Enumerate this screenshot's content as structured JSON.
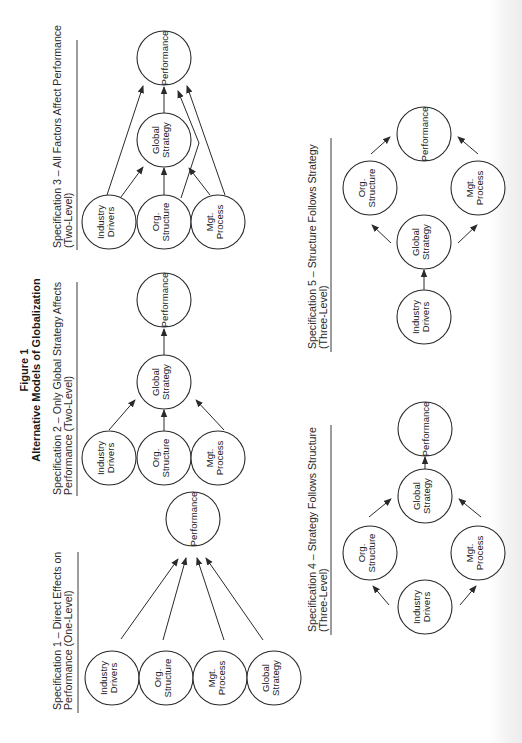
{
  "figure": {
    "number_label": "Figure 1",
    "title": "Alternative Models of Globalization",
    "orientation": "rotated 90 degrees counter-clockwise"
  },
  "colors": {
    "stroke": "#2a2a2a",
    "text": "#222222",
    "background": "#ffffff"
  },
  "specifications": [
    {
      "id": "spec1",
      "label_line1": "Specification 1 – Direct Effects on",
      "label_line2": "Performance (One-Level)",
      "nodes": [
        {
          "id": "perf",
          "lines": [
            "Performance"
          ],
          "cx": 193,
          "cy": 519
        },
        {
          "id": "ind",
          "lines": [
            "Industry",
            "Drivers"
          ],
          "cx": 112,
          "cy": 678
        },
        {
          "id": "org",
          "lines": [
            "Org.",
            "Structure"
          ],
          "cx": 166,
          "cy": 678
        },
        {
          "id": "mgt",
          "lines": [
            "Mgt.",
            "Process"
          ],
          "cx": 220,
          "cy": 678
        },
        {
          "id": "gs",
          "lines": [
            "Global",
            "Strategy"
          ],
          "cx": 274,
          "cy": 678
        }
      ],
      "edges": [
        {
          "from": "ind",
          "to": "perf",
          "points": [
            [
              121,
              639
            ],
            [
              178,
              559
            ]
          ]
        },
        {
          "from": "org",
          "to": "perf",
          "points": [
            [
              163,
              640
            ],
            [
              186,
              558
            ]
          ]
        },
        {
          "from": "mgt",
          "to": "perf",
          "points": [
            [
              224,
              640
            ],
            [
              197,
              558
            ]
          ]
        },
        {
          "from": "gs",
          "to": "perf",
          "points": [
            [
              263,
              640
            ],
            [
              206,
              558
            ]
          ]
        }
      ]
    },
    {
      "id": "spec2",
      "label_line1": "Specification 2 – Only Global Strategy Affects",
      "label_line2": "Performance (Two-Level)",
      "nodes": [
        {
          "id": "perf",
          "lines": [
            "Performance"
          ],
          "cx": 164,
          "cy": 300
        },
        {
          "id": "gs",
          "lines": [
            "Global",
            "Strategy"
          ],
          "cx": 164,
          "cy": 382
        },
        {
          "id": "ind",
          "lines": [
            "Industry",
            "Drivers"
          ],
          "cx": 109,
          "cy": 458
        },
        {
          "id": "org",
          "lines": [
            "Org.",
            "Structure"
          ],
          "cx": 164,
          "cy": 458
        },
        {
          "id": "mgt",
          "lines": [
            "Mgt.",
            "Process"
          ],
          "cx": 218,
          "cy": 458
        }
      ],
      "edges": [
        {
          "from": "gs",
          "to": "perf",
          "points": [
            [
              164,
              355
            ],
            [
              164,
              329
            ]
          ]
        },
        {
          "from": "ind",
          "to": "gs",
          "points": [
            [
              109,
              430
            ],
            [
              135,
              400
            ]
          ]
        },
        {
          "from": "org",
          "to": "gs",
          "points": [
            [
              164,
              431
            ],
            [
              164,
              410
            ]
          ]
        },
        {
          "from": "mgt",
          "to": "gs",
          "points": [
            [
              224,
              430
            ],
            [
              196,
              400
            ]
          ]
        }
      ]
    },
    {
      "id": "spec3",
      "label_line1": "Specification 3 –  All Factors Affect Performance",
      "label_line2": "(Two-Level)",
      "nodes": [
        {
          "id": "perf",
          "lines": [
            "Performance"
          ],
          "cx": 164,
          "cy": 58
        },
        {
          "id": "gs",
          "lines": [
            "Global",
            "Strategy"
          ],
          "cx": 164,
          "cy": 140
        },
        {
          "id": "ind",
          "lines": [
            "Industry",
            "Drivers"
          ],
          "cx": 109,
          "cy": 222
        },
        {
          "id": "org",
          "lines": [
            "Org.",
            "Structure"
          ],
          "cx": 164,
          "cy": 222
        },
        {
          "id": "mgt",
          "lines": [
            "Mgt.",
            "Process"
          ],
          "cx": 218,
          "cy": 222
        }
      ],
      "edges": [
        {
          "from": "ind",
          "to": "perf",
          "points": [
            [
              107,
              195
            ],
            [
              143,
              86
            ]
          ]
        },
        {
          "from": "ind",
          "to": "gs",
          "points": [
            [
              121,
              197
            ],
            [
              143,
              167
            ]
          ]
        },
        {
          "from": "gs",
          "to": "perf",
          "points": [
            [
              164,
              113
            ],
            [
              164,
              87
            ]
          ]
        },
        {
          "from": "org",
          "to": "gs",
          "points": [
            [
              164,
              195
            ],
            [
              164,
              168
            ]
          ]
        },
        {
          "from": "org",
          "to": "perf",
          "points": [
            [
              181,
              198
            ],
            [
              199,
              143
            ],
            [
              178,
              91
            ]
          ]
        },
        {
          "from": "mgt",
          "to": "gs",
          "points": [
            [
              210,
              195
            ],
            [
              189,
              168
            ]
          ]
        },
        {
          "from": "mgt",
          "to": "perf",
          "points": [
            [
              225,
              195
            ],
            [
              187,
              86
            ]
          ]
        }
      ]
    },
    {
      "id": "spec4",
      "label_line1": "Specification 4 – Strategy Follows Structure",
      "label_line2": "(Three-Level)",
      "nodes": [
        {
          "id": "perf",
          "lines": [
            "Performance"
          ],
          "cx": 425,
          "cy": 429
        },
        {
          "id": "gs",
          "lines": [
            "Global",
            "Strategy"
          ],
          "cx": 425,
          "cy": 496
        },
        {
          "id": "org",
          "lines": [
            "Org.",
            "Structure"
          ],
          "cx": 370,
          "cy": 553
        },
        {
          "id": "mgt",
          "lines": [
            "Mgt.",
            "Process"
          ],
          "cx": 478,
          "cy": 553
        },
        {
          "id": "ind",
          "lines": [
            "Industry",
            "Drivers"
          ],
          "cx": 425,
          "cy": 607
        }
      ],
      "edges": [
        {
          "from": "gs",
          "to": "perf",
          "points": [
            [
              425,
              469
            ],
            [
              425,
              457
            ]
          ]
        },
        {
          "from": "org",
          "to": "gs",
          "points": [
            [
              369,
              517
            ],
            [
              391,
              499
            ]
          ]
        },
        {
          "from": "mgt",
          "to": "gs",
          "points": [
            [
              481,
              517
            ],
            [
              459,
              499
            ]
          ]
        },
        {
          "from": "ind",
          "to": "org",
          "points": [
            [
              389,
              605
            ],
            [
              373,
              586
            ]
          ]
        },
        {
          "from": "ind",
          "to": "mgt",
          "points": [
            [
              460,
              605
            ],
            [
              476,
              586
            ]
          ]
        }
      ]
    },
    {
      "id": "spec5",
      "label_line1": "Specification 5 – Structure Follows Strategy",
      "label_line2": "(Three-Level)",
      "nodes": [
        {
          "id": "perf",
          "lines": [
            "Performance"
          ],
          "cx": 424,
          "cy": 134
        },
        {
          "id": "org",
          "lines": [
            "Org.",
            "Structure"
          ],
          "cx": 370,
          "cy": 188
        },
        {
          "id": "mgt",
          "lines": [
            "Mgt.",
            "Process"
          ],
          "cx": 478,
          "cy": 188
        },
        {
          "id": "gs",
          "lines": [
            "Global",
            "Strategy"
          ],
          "cx": 424,
          "cy": 242
        },
        {
          "id": "ind",
          "lines": [
            "Industry",
            "Drivers"
          ],
          "cx": 424,
          "cy": 317
        }
      ],
      "edges": [
        {
          "from": "org",
          "to": "perf",
          "points": [
            [
              371,
              154
            ],
            [
              390,
              137
            ]
          ]
        },
        {
          "from": "mgt",
          "to": "perf",
          "points": [
            [
              478,
              154
            ],
            [
              458,
              137
            ]
          ]
        },
        {
          "from": "gs",
          "to": "org",
          "points": [
            [
              391,
              243
            ],
            [
              372,
              225
            ]
          ]
        },
        {
          "from": "gs",
          "to": "mgt",
          "points": [
            [
              458,
              243
            ],
            [
              477,
              225
            ]
          ]
        },
        {
          "from": "ind",
          "to": "gs",
          "points": [
            [
              424,
              290
            ],
            [
              424,
              270
            ]
          ]
        }
      ]
    }
  ],
  "layout": {
    "node_radius": 27,
    "label_positions": {
      "spec1": {
        "x1": 57,
        "x2": 68,
        "y": 710,
        "rule_x": 78,
        "rule_y1": 552,
        "rule_y2": 713
      },
      "spec2": {
        "x1": 57,
        "x2": 68,
        "y": 495,
        "rule_x": 77,
        "rule_y1": 282,
        "rule_y2": 496
      },
      "spec3": {
        "x1": 57,
        "x2": 68,
        "y": 248,
        "rule_x": 77,
        "rule_y1": 40,
        "rule_y2": 250
      },
      "spec4": {
        "x1": 312,
        "x2": 323,
        "y": 632,
        "rule_x": 331,
        "rule_y1": 425,
        "rule_y2": 635
      },
      "spec5": {
        "x1": 312,
        "x2": 323,
        "y": 349,
        "rule_x": 331,
        "rule_y1": 138,
        "rule_y2": 352
      }
    },
    "title_position": {
      "x1": 28,
      "x2": 40,
      "y": 370
    }
  }
}
